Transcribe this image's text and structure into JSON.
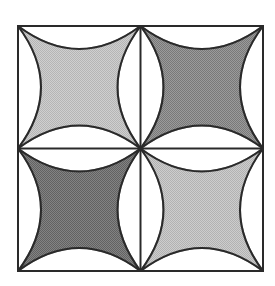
{
  "figure": {
    "outer_square": {
      "x": 18,
      "y": 26,
      "size": 245
    },
    "line_color": "#2a2a2a",
    "background": "#ffffff",
    "arc_control_offset": 46,
    "cells": [
      {
        "id": "top-left",
        "fill": "#c6c6c6"
      },
      {
        "id": "top-right",
        "fill": "#8c8c8c"
      },
      {
        "id": "bottom-left",
        "fill": "#747474"
      },
      {
        "id": "bottom-right",
        "fill": "#c0c0c0"
      }
    ]
  }
}
